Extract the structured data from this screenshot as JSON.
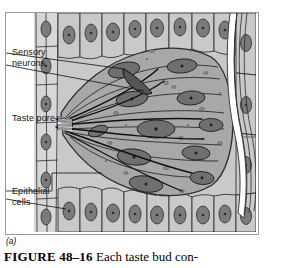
{
  "figure": {
    "panel_letter": "(a)",
    "caption_number": "FIGURE 48–16",
    "caption_text": "Each taste bud con-",
    "labels": {
      "sensory_neurons": "Sensory\nneurons",
      "taste_pore": "Taste pore",
      "epithelial_cells": "Epithelial\ncells"
    },
    "colors": {
      "frame_border": "#9a9a9a",
      "epithelium_fill": "#c9c9c9",
      "taste_bud_fill": "#a8a8a8",
      "nucleus_fill": "#7b7b7b",
      "outline": "#2b2b2b",
      "nerve_fiber": "#1a1a1a",
      "background": "#ffffff"
    },
    "diagram_parts": [
      "stratified epithelial cells",
      "taste bud",
      "taste (gustatory) cells",
      "cell nuclei",
      "taste pore with microvilli",
      "sensory nerve fibers",
      "nerve fiber bundle"
    ]
  }
}
